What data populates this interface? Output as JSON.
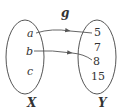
{
  "diagram": {
    "function_name": "g",
    "domain": {
      "label": "X",
      "elements": [
        "a",
        "b",
        "c"
      ]
    },
    "codomain": {
      "label": "Y",
      "elements": [
        "5",
        "7",
        "8",
        "15"
      ]
    },
    "mappings": [
      {
        "from": "a",
        "to": "5"
      },
      {
        "from": "b",
        "to": "8"
      }
    ],
    "colors": {
      "stroke": "#555555",
      "text": "#333333"
    }
  }
}
